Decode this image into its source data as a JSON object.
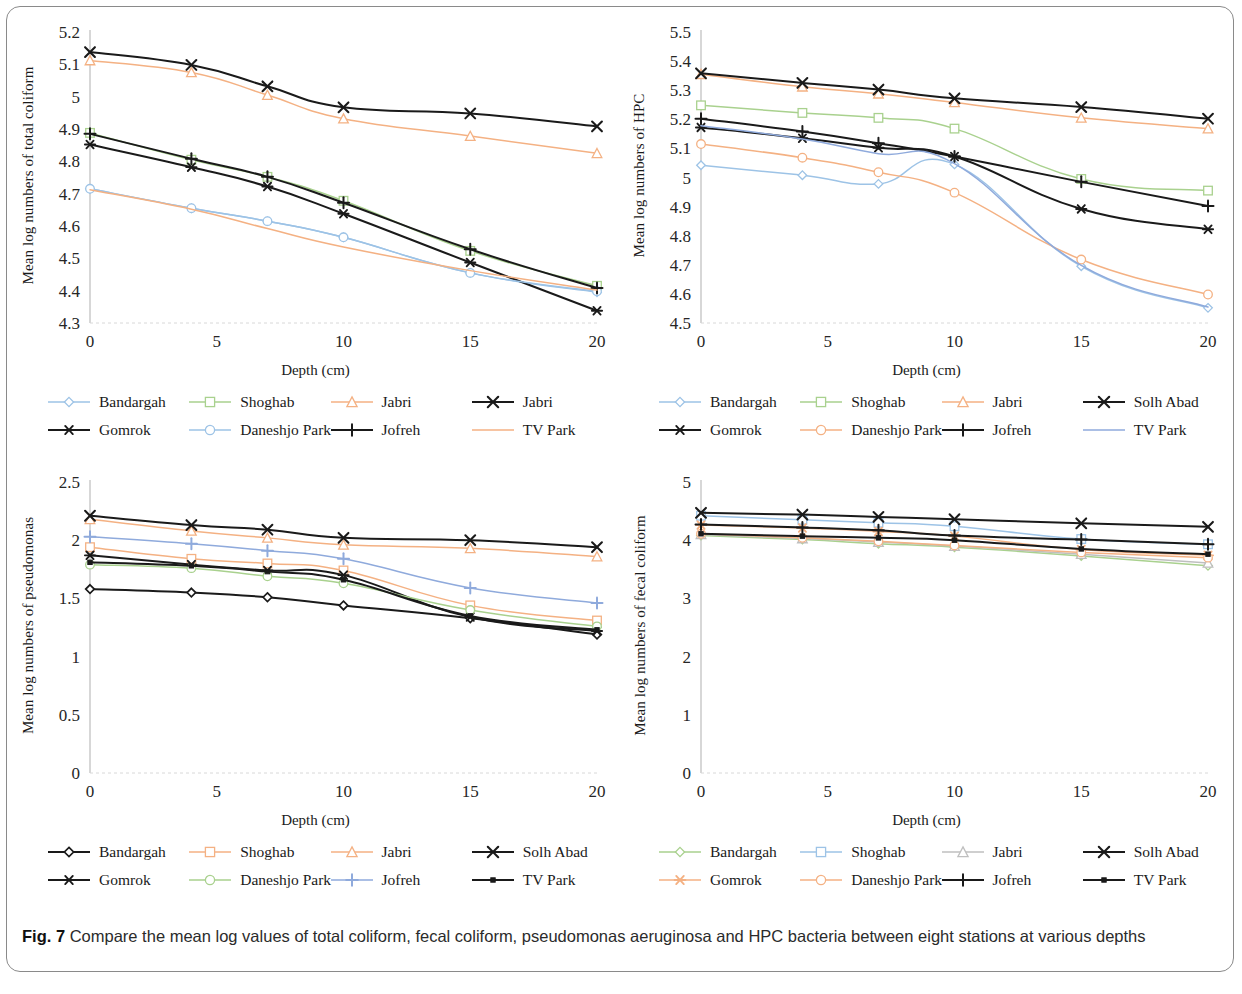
{
  "caption": {
    "label": "Fig. 7",
    "text": " Compare the mean log values of total coliform, fecal coliform, pseudomonas aeruginosa and HPC bacteria between eight stations at various depths"
  },
  "shared": {
    "xlabel": "Depth (cm)",
    "xticks": [
      "0",
      "5",
      "10",
      "15",
      "20"
    ],
    "x_points": [
      0,
      4,
      7,
      10,
      15,
      20
    ]
  },
  "chart_data": [
    {
      "id": "total-coliform",
      "type": "line",
      "title": "",
      "ylabel": "Mean log numbers of total coliform",
      "xlabel": "Depth (cm)",
      "x": [
        0,
        4,
        7,
        10,
        15,
        20
      ],
      "xticks": [
        "0",
        "5",
        "10",
        "15",
        "20"
      ],
      "yticks": [
        "4.3",
        "4.4",
        "4.5",
        "4.6",
        "4.7",
        "4.8",
        "4.9",
        "5",
        "5.1",
        "5.2"
      ],
      "xlim": [
        0,
        20
      ],
      "ylim": [
        4.3,
        5.2
      ],
      "grid": false,
      "legend_position": "bottom",
      "series": [
        {
          "name": "Bandargah",
          "color": "#9dc3e6",
          "marker": "diamond",
          "values": [
            4.715,
            4.655,
            4.615,
            4.565,
            4.455,
            4.395
          ]
        },
        {
          "name": "Shoghab",
          "color": "#a9d18e",
          "marker": "square",
          "values": [
            4.888,
            4.805,
            4.752,
            4.678,
            4.523,
            4.415
          ]
        },
        {
          "name": "Jabri",
          "color": "#f4b183",
          "marker": "triangle",
          "values": [
            5.112,
            5.075,
            5.005,
            4.932,
            4.878,
            4.825
          ]
        },
        {
          "name": "Jabri",
          "color": "#1a1a1a",
          "marker": "cross",
          "values": [
            5.138,
            5.098,
            5.032,
            4.967,
            4.948,
            4.908
          ]
        },
        {
          "name": "Gomrok",
          "color": "#1a1a1a",
          "marker": "asterisk",
          "values": [
            4.852,
            4.782,
            4.722,
            4.638,
            4.487,
            4.338
          ]
        },
        {
          "name": "Daneshjo Park",
          "color": "#9dc3e6",
          "marker": "circle",
          "values": [
            4.715,
            4.655,
            4.615,
            4.565,
            4.455,
            4.398
          ]
        },
        {
          "name": "Jofreh",
          "color": "#1a1a1a",
          "marker": "plus",
          "values": [
            4.885,
            4.808,
            4.752,
            4.672,
            4.528,
            4.408
          ]
        },
        {
          "name": "TV Park",
          "color": "#f4b183",
          "marker": "none",
          "values": [
            4.712,
            4.652,
            4.592,
            4.535,
            4.462,
            4.402
          ]
        }
      ]
    },
    {
      "id": "hpc",
      "type": "line",
      "title": "",
      "ylabel": "Mean log numbers of HPC",
      "xlabel": "Depth (cm)",
      "x": [
        0,
        4,
        7,
        10,
        15,
        20
      ],
      "xticks": [
        "0",
        "5",
        "10",
        "15",
        "20"
      ],
      "yticks": [
        "4.5",
        "4.6",
        "4.7",
        "4.8",
        "4.9",
        "5",
        "5.1",
        "5.2",
        "5.3",
        "5.4",
        "5.5"
      ],
      "xlim": [
        0,
        20
      ],
      "ylim": [
        4.5,
        5.5
      ],
      "grid": false,
      "legend_position": "bottom",
      "series": [
        {
          "name": "Bandargah",
          "color": "#9dc3e6",
          "marker": "diamond",
          "values": [
            5.042,
            5.008,
            4.978,
            5.045,
            4.695,
            4.552
          ]
        },
        {
          "name": "Shoghab",
          "color": "#a9d18e",
          "marker": "square",
          "values": [
            5.248,
            5.222,
            5.205,
            5.168,
            4.995,
            4.955
          ]
        },
        {
          "name": "Jabri",
          "color": "#f4b183",
          "marker": "triangle",
          "values": [
            5.355,
            5.312,
            5.288,
            5.258,
            5.205,
            5.168
          ]
        },
        {
          "name": "Solh Abad",
          "color": "#1a1a1a",
          "marker": "cross",
          "values": [
            5.358,
            5.325,
            5.302,
            5.272,
            5.242,
            5.202
          ]
        },
        {
          "name": "Gomrok",
          "color": "#1a1a1a",
          "marker": "asterisk",
          "values": [
            5.172,
            5.135,
            5.102,
            5.072,
            4.892,
            4.822
          ]
        },
        {
          "name": "Daneshjo Park",
          "color": "#f4b183",
          "marker": "circle",
          "values": [
            5.115,
            5.068,
            5.018,
            4.948,
            4.718,
            4.598
          ]
        },
        {
          "name": "Jofreh",
          "color": "#1a1a1a",
          "marker": "plus",
          "values": [
            5.202,
            5.158,
            5.118,
            5.072,
            4.985,
            4.902
          ]
        },
        {
          "name": "TV Park",
          "color": "#8faadc",
          "marker": "none",
          "values": [
            5.178,
            5.132,
            5.082,
            5.048,
            4.698,
            4.555
          ]
        }
      ]
    },
    {
      "id": "pseudomonas",
      "type": "line",
      "title": "",
      "ylabel": "Mean log numbers of pseudomonas",
      "xlabel": "Depth (cm)",
      "x": [
        0,
        4,
        7,
        10,
        15,
        20
      ],
      "xticks": [
        "0",
        "5",
        "10",
        "15",
        "20"
      ],
      "yticks": [
        "0",
        "0.5",
        "1",
        "1.5",
        "2",
        "2.5"
      ],
      "xlim": [
        0,
        20
      ],
      "ylim": [
        0,
        2.5
      ],
      "grid": false,
      "legend_position": "bottom",
      "series": [
        {
          "name": "Bandargah",
          "color": "#1a1a1a",
          "marker": "diamond",
          "values": [
            1.58,
            1.55,
            1.51,
            1.44,
            1.33,
            1.19
          ]
        },
        {
          "name": "Shoghab",
          "color": "#f4b183",
          "marker": "square",
          "values": [
            1.94,
            1.84,
            1.8,
            1.74,
            1.44,
            1.31
          ]
        },
        {
          "name": "Jabri",
          "color": "#f4b183",
          "marker": "triangle",
          "values": [
            2.18,
            2.08,
            2.02,
            1.96,
            1.93,
            1.86
          ]
        },
        {
          "name": "Solh Abad",
          "color": "#1a1a1a",
          "marker": "cross",
          "values": [
            2.21,
            2.13,
            2.09,
            2.02,
            2.0,
            1.94
          ]
        },
        {
          "name": "Gomrok",
          "color": "#1a1a1a",
          "marker": "asterisk",
          "values": [
            1.87,
            1.79,
            1.74,
            1.7,
            1.34,
            1.22
          ]
        },
        {
          "name": "Daneshjo Park",
          "color": "#a9d18e",
          "marker": "circle",
          "values": [
            1.79,
            1.76,
            1.69,
            1.63,
            1.4,
            1.26
          ]
        },
        {
          "name": "Jofreh",
          "color": "#8faadc",
          "marker": "plus",
          "values": [
            2.03,
            1.97,
            1.91,
            1.84,
            1.59,
            1.46
          ]
        },
        {
          "name": "TV Park",
          "color": "#1a1a1a",
          "marker": "dot",
          "values": [
            1.81,
            1.78,
            1.73,
            1.66,
            1.35,
            1.23
          ]
        }
      ]
    },
    {
      "id": "fecal-coliform",
      "type": "line",
      "title": "",
      "ylabel": "Mean log numbers of fecal coliform",
      "xlabel": "Depth (cm)",
      "x": [
        0,
        4,
        7,
        10,
        15,
        20
      ],
      "xticks": [
        "0",
        "5",
        "10",
        "15",
        "20"
      ],
      "yticks": [
        "0",
        "1",
        "2",
        "3",
        "4",
        "5"
      ],
      "xlim": [
        0,
        20
      ],
      "ylim": [
        0,
        5
      ],
      "grid": false,
      "legend_position": "bottom",
      "series": [
        {
          "name": "Bandargah",
          "color": "#a9d18e",
          "marker": "diamond",
          "values": [
            4.08,
            4.01,
            3.94,
            3.88,
            3.73,
            3.56
          ]
        },
        {
          "name": "Shoghab",
          "color": "#9dc3e6",
          "marker": "square",
          "values": [
            4.42,
            4.35,
            4.3,
            4.24,
            4.02,
            3.93
          ]
        },
        {
          "name": "Jabri",
          "color": "#bfbfbf",
          "marker": "triangle",
          "values": [
            4.1,
            4.03,
            3.97,
            3.9,
            3.76,
            3.61
          ]
        },
        {
          "name": "Solh Abad",
          "color": "#1a1a1a",
          "marker": "cross",
          "values": [
            4.47,
            4.44,
            4.4,
            4.36,
            4.29,
            4.23
          ]
        },
        {
          "name": "Gomrok",
          "color": "#f4b183",
          "marker": "asterisk",
          "values": [
            4.26,
            4.21,
            4.15,
            4.07,
            3.84,
            3.74
          ]
        },
        {
          "name": "Daneshjo Park",
          "color": "#f4b183",
          "marker": "circle",
          "values": [
            4.11,
            4.04,
            3.98,
            3.91,
            3.79,
            3.7
          ]
        },
        {
          "name": "Jofreh",
          "color": "#1a1a1a",
          "marker": "plus",
          "values": [
            4.27,
            4.22,
            4.17,
            4.08,
            4.01,
            3.93
          ]
        },
        {
          "name": "TV Park",
          "color": "#1a1a1a",
          "marker": "dot",
          "values": [
            4.11,
            4.07,
            4.04,
            4.0,
            3.85,
            3.76
          ]
        }
      ]
    }
  ]
}
